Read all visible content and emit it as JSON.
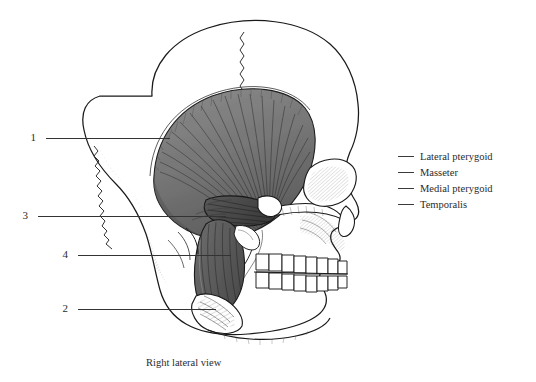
{
  "figure": {
    "caption": "Right lateral view",
    "view": "right lateral",
    "background_color": "#ffffff",
    "ink_color": "#1a1a1a",
    "label_color": "#2b2b2b"
  },
  "callouts": [
    {
      "number": "1",
      "label_x": 34,
      "label_y": 132,
      "line_x1": 46,
      "line_x2": 170,
      "line_y": 138
    },
    {
      "number": "3",
      "label_x": 26,
      "label_y": 210,
      "line_x1": 38,
      "line_x2": 226,
      "line_y": 216
    },
    {
      "number": "4",
      "label_x": 66,
      "label_y": 249,
      "line_x1": 78,
      "line_x2": 231,
      "line_y": 255
    },
    {
      "number": "2",
      "label_x": 66,
      "label_y": 303,
      "line_x1": 78,
      "line_x2": 216,
      "line_y": 309
    }
  ],
  "legend": {
    "items": [
      {
        "label": "Lateral pterygoid",
        "swatch": "dash"
      },
      {
        "label": "Masseter",
        "swatch": "dash"
      },
      {
        "label": "Medial pterygoid",
        "swatch": "dash"
      },
      {
        "label": "Temporalis",
        "swatch": "dash"
      }
    ]
  }
}
